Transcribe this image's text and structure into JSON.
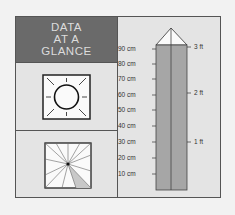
{
  "title_lines": [
    "DATA",
    "AT A",
    "GLANCE"
  ],
  "icons": {
    "top": "sun-icon",
    "bottom": "pie-spoke-icon"
  },
  "ruler": {
    "cm_ticks": [
      {
        "label": "90 cm",
        "value": 90
      },
      {
        "label": "80 cm",
        "value": 80
      },
      {
        "label": "70 cm",
        "value": 70
      },
      {
        "label": "60 cm",
        "value": 60
      },
      {
        "label": "50 cm",
        "value": 50
      },
      {
        "label": "40 cm",
        "value": 40
      },
      {
        "label": "30 cm",
        "value": 30
      },
      {
        "label": "20 cm",
        "value": 20
      },
      {
        "label": "10 cm",
        "value": 10
      }
    ],
    "ft_ticks": [
      {
        "label": "3 ft",
        "value": 3
      },
      {
        "label": "2 ft",
        "value": 2
      },
      {
        "label": "1 ft",
        "value": 1
      }
    ]
  },
  "colors": {
    "header_bg": "#6a6a6a",
    "panel_bg": "#e4e4e4",
    "column_fill": "#a6a6a6"
  }
}
